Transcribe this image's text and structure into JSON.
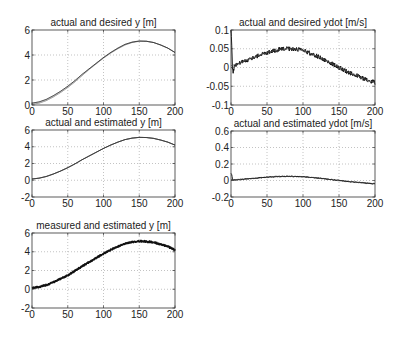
{
  "figure": {
    "width": 401,
    "height": 338,
    "background": "#ffffff"
  },
  "chart_data": [
    {
      "id": "actual-desired-y",
      "type": "line",
      "title": "actual and desired y [m]",
      "xlabel": "",
      "ylabel": "",
      "xlim": [
        0,
        200
      ],
      "ylim": [
        0,
        6
      ],
      "xticks": [
        0,
        50,
        100,
        150,
        200
      ],
      "yticks": [
        0,
        2,
        4,
        6
      ],
      "xtick_labels": [
        "0",
        "50",
        "100",
        "150",
        "200"
      ],
      "ytick_labels": [
        "0",
        "2",
        "4",
        "6"
      ],
      "grid": true,
      "box": {
        "x": 32,
        "y": 30,
        "w": 143,
        "h": 75
      },
      "series": [
        {
          "name": "desired",
          "color": "#8a8a8a",
          "width": 1.0,
          "noise": 0,
          "x": [
            0,
            10,
            20,
            30,
            40,
            50,
            60,
            70,
            80,
            90,
            100,
            110,
            120,
            130,
            140,
            150,
            160,
            170,
            180,
            190,
            200
          ],
          "values": [
            0.05,
            0.15,
            0.35,
            0.65,
            1.0,
            1.4,
            1.85,
            2.35,
            2.85,
            3.3,
            3.75,
            4.15,
            4.5,
            4.8,
            5.0,
            5.1,
            5.1,
            5.0,
            4.8,
            4.55,
            4.2
          ]
        },
        {
          "name": "actual",
          "color": "#222222",
          "width": 1.0,
          "noise": 0,
          "x": [
            0,
            10,
            20,
            30,
            40,
            50,
            60,
            70,
            80,
            90,
            100,
            110,
            120,
            130,
            140,
            150,
            160,
            170,
            180,
            190,
            200
          ],
          "values": [
            0.15,
            0.25,
            0.45,
            0.75,
            1.1,
            1.5,
            1.95,
            2.45,
            2.9,
            3.35,
            3.8,
            4.2,
            4.55,
            4.85,
            5.03,
            5.12,
            5.1,
            5.0,
            4.8,
            4.55,
            4.2
          ]
        }
      ]
    },
    {
      "id": "actual-desired-ydot",
      "type": "line",
      "title": "actual and desired ydot [m/s]",
      "xlabel": "",
      "ylabel": "",
      "xlim": [
        0,
        200
      ],
      "ylim": [
        -0.1,
        0.1
      ],
      "xticks": [
        0,
        50,
        100,
        150,
        200
      ],
      "yticks": [
        -0.1,
        -0.05,
        0,
        0.05,
        0.1
      ],
      "xtick_labels": [
        "0",
        "50",
        "100",
        "150",
        "200"
      ],
      "ytick_labels": [
        "-0.1",
        "-0.05",
        "0",
        "0.05",
        "0.1"
      ],
      "grid": true,
      "box": {
        "x": 231,
        "y": 30,
        "w": 144,
        "h": 75
      },
      "series": [
        {
          "name": "actual",
          "color": "#111111",
          "width": 1.0,
          "noise": 0.006,
          "x": [
            0,
            1,
            2,
            3,
            5,
            10,
            20,
            30,
            40,
            50,
            60,
            70,
            80,
            90,
            100,
            110,
            120,
            130,
            140,
            150,
            160,
            170,
            180,
            190,
            200
          ],
          "values": [
            0.1,
            0.06,
            0.0,
            -0.01,
            0.005,
            0.01,
            0.018,
            0.025,
            0.033,
            0.04,
            0.045,
            0.049,
            0.05,
            0.049,
            0.045,
            0.038,
            0.03,
            0.02,
            0.01,
            0.0,
            -0.01,
            -0.018,
            -0.026,
            -0.034,
            -0.04
          ]
        },
        {
          "name": "desired",
          "color": "#555555",
          "width": 0.8,
          "noise": 0,
          "x": [
            0,
            10,
            20,
            30,
            40,
            50,
            60,
            70,
            80,
            90,
            100,
            110,
            120,
            130,
            140,
            150,
            160,
            170,
            180,
            190,
            200
          ],
          "values": [
            0.005,
            0.01,
            0.018,
            0.025,
            0.033,
            0.04,
            0.045,
            0.049,
            0.05,
            0.049,
            0.045,
            0.038,
            0.03,
            0.02,
            0.01,
            0.0,
            -0.01,
            -0.018,
            -0.026,
            -0.034,
            -0.04
          ]
        }
      ]
    },
    {
      "id": "actual-estimated-y",
      "type": "line",
      "title": "actual and estimated y [m]",
      "xlabel": "",
      "ylabel": "",
      "xlim": [
        0,
        200
      ],
      "ylim": [
        -2,
        6
      ],
      "xticks": [
        0,
        50,
        100,
        150,
        200
      ],
      "yticks": [
        -2,
        0,
        2,
        4,
        6
      ],
      "xtick_labels": [
        "0",
        "50",
        "100",
        "150",
        "200"
      ],
      "ytick_labels": [
        "-2",
        "0",
        "2",
        "4",
        "6"
      ],
      "grid": true,
      "box": {
        "x": 32,
        "y": 130,
        "w": 143,
        "h": 67
      },
      "series": [
        {
          "name": "actual",
          "color": "#222222",
          "width": 1.0,
          "noise": 0,
          "x": [
            0,
            10,
            20,
            30,
            40,
            50,
            60,
            70,
            80,
            90,
            100,
            110,
            120,
            130,
            140,
            150,
            160,
            170,
            180,
            190,
            200
          ],
          "values": [
            0.15,
            0.25,
            0.45,
            0.75,
            1.1,
            1.5,
            1.95,
            2.45,
            2.9,
            3.35,
            3.8,
            4.2,
            4.55,
            4.85,
            5.03,
            5.12,
            5.1,
            5.0,
            4.8,
            4.55,
            4.2
          ]
        },
        {
          "name": "estimated",
          "color": "#333333",
          "width": 0.8,
          "noise": 0,
          "x": [
            0,
            10,
            20,
            30,
            40,
            50,
            60,
            70,
            80,
            90,
            100,
            110,
            120,
            130,
            140,
            150,
            160,
            170,
            180,
            190,
            200
          ],
          "values": [
            0.15,
            0.25,
            0.45,
            0.75,
            1.1,
            1.5,
            1.95,
            2.45,
            2.9,
            3.35,
            3.8,
            4.2,
            4.55,
            4.85,
            5.03,
            5.12,
            5.1,
            5.0,
            4.8,
            4.55,
            4.2
          ]
        }
      ]
    },
    {
      "id": "actual-estimated-ydot",
      "type": "line",
      "title": "actual and estimated ydot [m/s]",
      "xlabel": "",
      "ylabel": "",
      "xlim": [
        0,
        200
      ],
      "ylim": [
        -0.2,
        0.6
      ],
      "xticks": [
        0,
        50,
        100,
        150,
        200
      ],
      "yticks": [
        -0.2,
        0,
        0.2,
        0.4,
        0.6
      ],
      "xtick_labels": [
        "0",
        "50",
        "100",
        "150",
        "200"
      ],
      "ytick_labels": [
        "-0.2",
        "0",
        "0.2",
        "0.4",
        "0.6"
      ],
      "grid": true,
      "box": {
        "x": 231,
        "y": 131,
        "w": 144,
        "h": 66
      },
      "series": [
        {
          "name": "actual",
          "color": "#111111",
          "width": 1.0,
          "noise": 0.005,
          "x": [
            0,
            10,
            20,
            30,
            40,
            50,
            60,
            70,
            80,
            90,
            100,
            110,
            120,
            130,
            140,
            150,
            160,
            170,
            180,
            190,
            200
          ],
          "values": [
            0.005,
            0.01,
            0.018,
            0.025,
            0.033,
            0.04,
            0.045,
            0.049,
            0.05,
            0.049,
            0.045,
            0.038,
            0.03,
            0.02,
            0.01,
            0.0,
            -0.01,
            -0.018,
            -0.026,
            -0.034,
            -0.04
          ]
        },
        {
          "name": "estimated",
          "color": "#222222",
          "width": 1.0,
          "noise": 0.004,
          "x": [
            0,
            1,
            2,
            3,
            5,
            10,
            20,
            30,
            40,
            50,
            60,
            70,
            80,
            90,
            100,
            110,
            120,
            130,
            140,
            150,
            160,
            170,
            180,
            190,
            200
          ],
          "values": [
            0.09,
            0.07,
            0.02,
            0.0,
            0.005,
            0.01,
            0.018,
            0.025,
            0.033,
            0.04,
            0.045,
            0.049,
            0.05,
            0.049,
            0.045,
            0.038,
            0.03,
            0.02,
            0.01,
            0.0,
            -0.01,
            -0.018,
            -0.026,
            -0.034,
            -0.04
          ]
        }
      ]
    },
    {
      "id": "measured-estimated-y",
      "type": "line",
      "title": "measured and estimated y [m]",
      "xlabel": "",
      "ylabel": "",
      "xlim": [
        0,
        200
      ],
      "ylim": [
        -2,
        6
      ],
      "xticks": [
        0,
        50,
        100,
        150,
        200
      ],
      "yticks": [
        -2,
        0,
        2,
        4,
        6
      ],
      "xtick_labels": [
        "0",
        "50",
        "100",
        "150",
        "200"
      ],
      "ytick_labels": [
        "-2",
        "0",
        "2",
        "4",
        "6"
      ],
      "grid": true,
      "box": {
        "x": 32,
        "y": 233,
        "w": 143,
        "h": 75
      },
      "series": [
        {
          "name": "measured",
          "color": "#111111",
          "width": 1.6,
          "noise": 0.09,
          "x": [
            0,
            10,
            20,
            30,
            40,
            50,
            60,
            70,
            80,
            90,
            100,
            110,
            120,
            130,
            140,
            150,
            160,
            170,
            180,
            190,
            200
          ],
          "values": [
            0.15,
            0.25,
            0.45,
            0.75,
            1.1,
            1.5,
            1.95,
            2.45,
            2.9,
            3.35,
            3.8,
            4.2,
            4.55,
            4.85,
            5.03,
            5.12,
            5.1,
            5.0,
            4.8,
            4.55,
            4.2
          ]
        },
        {
          "name": "estimated",
          "color": "#111111",
          "width": 1.2,
          "noise": 0,
          "x": [
            0,
            10,
            20,
            30,
            40,
            50,
            60,
            70,
            80,
            90,
            100,
            110,
            120,
            130,
            140,
            150,
            160,
            170,
            180,
            190,
            200
          ],
          "values": [
            0.15,
            0.25,
            0.45,
            0.75,
            1.1,
            1.5,
            1.95,
            2.45,
            2.9,
            3.35,
            3.8,
            4.2,
            4.55,
            4.85,
            5.03,
            5.12,
            5.1,
            5.0,
            4.8,
            4.55,
            4.2
          ]
        }
      ]
    }
  ],
  "style": {
    "axis_color": "#333333",
    "grid_color": "#9a9a9a",
    "text_color": "#222222",
    "tick_font_size": 10,
    "title_font_size": 10
  }
}
